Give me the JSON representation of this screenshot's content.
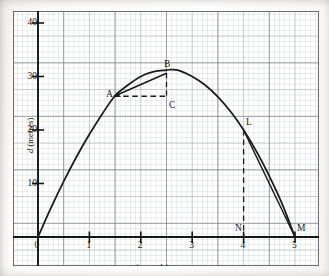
{
  "figure": {
    "kind": "graph-paper-plot",
    "background_color": "#fdfdfc",
    "grid_minor_color": "#b9bcc4",
    "grid_major_color": "#8d9098",
    "grid_heavy_color": "#6b6e76",
    "ink_color": "#1a1a1a"
  },
  "axes": {
    "x": {
      "label_prefix": "t",
      "label_suffix": " (seconds)",
      "label_full": "t (seconds)",
      "ticks": [
        "0",
        "1",
        "2",
        "3",
        "4",
        "5"
      ],
      "tick_values": [
        0,
        1,
        2,
        3,
        4,
        5
      ],
      "range": [
        0,
        5.45
      ],
      "origin_px": 38,
      "px_per_unit": 51.4
    },
    "y": {
      "label_prefix": "d",
      "label_suffix": " (metres)",
      "label_full": "d (metres)",
      "ticks": [
        "10",
        "20",
        "30",
        "40"
      ],
      "tick_values": [
        10,
        20,
        30,
        40
      ],
      "range": [
        0,
        44
      ],
      "origin_px": 237,
      "px_per_unit": 5.35
    },
    "grid": {
      "minor_step_x": 0.1,
      "minor_step_y": 1,
      "major_step_x": 0.5,
      "major_step_y": 5,
      "heavy_step_x": 1,
      "heavy_step_y": 10
    }
  },
  "chart_data": {
    "type": "line",
    "title": "",
    "xlabel": "t (seconds)",
    "ylabel": "d (metres)",
    "xlim": [
      0,
      5.45
    ],
    "ylim": [
      0,
      44
    ],
    "grid": true,
    "legend": "none",
    "series": [
      {
        "name": "distance-time curve",
        "kind": "smooth-curve",
        "x": [
          0,
          0.25,
          0.5,
          0.75,
          1,
          1.25,
          1.5,
          1.75,
          2,
          2.25,
          2.5,
          2.6,
          2.75,
          3,
          3.25,
          3.5,
          3.75,
          4,
          4.25,
          4.5,
          4.75,
          5
        ],
        "y": [
          0,
          5.4,
          10.4,
          15.0,
          19.2,
          23.0,
          26.4,
          28.4,
          30.0,
          30.9,
          31.2,
          31.3,
          31.1,
          30.0,
          28.4,
          26.2,
          23.4,
          20.0,
          16.0,
          11.4,
          6.2,
          0
        ]
      },
      {
        "name": "chord-A-to-B",
        "kind": "straight-chord",
        "x": [
          1.48,
          2.5
        ],
        "y": [
          26.3,
          30.6
        ]
      },
      {
        "name": "chord-L-to-M",
        "kind": "straight-chord",
        "x": [
          4,
          5
        ],
        "y": [
          20.0,
          0
        ]
      }
    ],
    "annotations": [
      {
        "label": "A",
        "x": 1.48,
        "y": 26.3,
        "on": "curve"
      },
      {
        "label": "B",
        "x": 2.5,
        "y": 30.6,
        "on": "curve"
      },
      {
        "label": "C",
        "x": 2.5,
        "y": 26.3,
        "on": "construction"
      },
      {
        "label": "L",
        "x": 4.0,
        "y": 20.0,
        "on": "curve"
      },
      {
        "label": "M",
        "x": 5.0,
        "y": 0.0,
        "on": "axis"
      },
      {
        "label": "N",
        "x": 4.0,
        "y": 0.0,
        "on": "axis"
      }
    ],
    "construction_lines": [
      {
        "name": "dashed-A-to-C",
        "from": "A",
        "to": "C",
        "style": "dashed",
        "orientation": "horizontal"
      },
      {
        "name": "dashed-B-to-C",
        "from": "B",
        "to": "C",
        "style": "dashed",
        "orientation": "vertical"
      },
      {
        "name": "dashed-L-to-N",
        "from": "L",
        "to": "N",
        "style": "dashed",
        "orientation": "vertical"
      }
    ],
    "arrow": {
      "name": "arrow-B-to-A",
      "from": "B",
      "to": "A"
    }
  },
  "point_labels": {
    "A": "A",
    "B": "B",
    "C": "C",
    "L": "L",
    "M": "M",
    "N": "N"
  }
}
